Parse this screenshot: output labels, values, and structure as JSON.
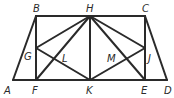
{
  "figure": {
    "type": "geometry",
    "points": {
      "A": [
        13,
        80
      ],
      "B": [
        36,
        16
      ],
      "C": [
        145,
        16
      ],
      "D": [
        167,
        80
      ],
      "F": [
        36,
        80
      ],
      "K": [
        90,
        80
      ],
      "E": [
        145,
        80
      ],
      "H": [
        90,
        16
      ],
      "G": [
        36,
        48
      ],
      "J": [
        145,
        48
      ]
    },
    "labels": {
      "A": "A",
      "B": "B",
      "C": "C",
      "D": "D",
      "E": "E",
      "F": "F",
      "G": "G",
      "H": "H",
      "J": "J",
      "K": "K",
      "L": "L",
      "M": "M"
    },
    "segments": [
      [
        "A",
        "D"
      ],
      [
        "B",
        "C"
      ],
      [
        "A",
        "B"
      ],
      [
        "C",
        "D"
      ],
      [
        "B",
        "F"
      ],
      [
        "H",
        "K"
      ],
      [
        "C",
        "E"
      ],
      [
        "H",
        "F"
      ],
      [
        "H",
        "G"
      ],
      [
        "H",
        "E"
      ],
      [
        "H",
        "J"
      ],
      [
        "K",
        "G"
      ],
      [
        "K",
        "J"
      ]
    ],
    "stroke_color": "#2a2a2a"
  }
}
